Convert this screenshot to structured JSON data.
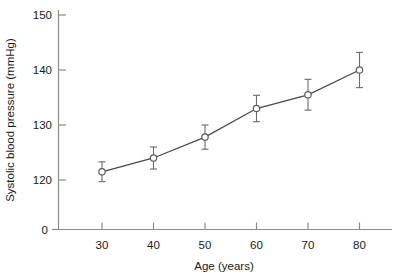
{
  "chart_data": {
    "type": "line",
    "title": "",
    "xlabel": "Age (years)",
    "ylabel": "Systolic blood pressure (mmHg)",
    "x": [
      30,
      40,
      50,
      60,
      70,
      80
    ],
    "values": [
      121.5,
      124.0,
      127.8,
      133.0,
      135.5,
      140.0
    ],
    "errors": [
      1.8,
      2.0,
      2.2,
      2.4,
      2.8,
      3.2
    ],
    "xtick_labels": [
      "30",
      "40",
      "50",
      "60",
      "70",
      "80"
    ],
    "ytick_labels": [
      "0",
      "120",
      "130",
      "140",
      "150"
    ],
    "ytick_values": [
      0,
      120,
      130,
      140,
      150
    ],
    "xlim": [
      25,
      85
    ],
    "ylim": [
      118,
      152
    ],
    "axis_break": true,
    "grid": false,
    "legend": "none",
    "marker": "open-circle",
    "error_bar_style": "capped",
    "colors": {
      "line": "#4a4a4a",
      "marker_fill": "#ffffff",
      "marker_stroke": "#5a5a5a",
      "axis": "#8a8a8a",
      "text": "#1a1a1a",
      "background": "#ffffff"
    }
  }
}
